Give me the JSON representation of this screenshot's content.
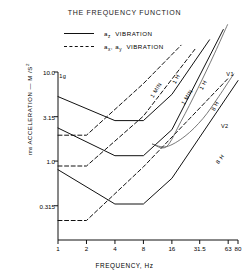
{
  "title": "THE FREQUENCY FUNCTION",
  "legend": [
    {
      "label": "a",
      "sub": "z",
      "tail": " VIBRATION",
      "style": "solid",
      "key": "legend-key-solid"
    },
    {
      "label": "a",
      "sub": "x, ay",
      "tail": " VIBRATION",
      "style": "dashed",
      "key": "legend-key-dashed"
    }
  ],
  "legend_text": {
    "solid": "az  VIBRATION",
    "dashed": "ax, ay  VIBRATION"
  },
  "axes": {
    "ylabel_main": "ACCELERATION",
    "ylabel_prefix": "rms",
    "ylabel_units": "M /S",
    "ylabel_exp": "2",
    "xlabel": "FREQUENCY, Hz",
    "unity_marker": "1g"
  },
  "chart_data": {
    "type": "line",
    "title": "THE FREQUENCY FUNCTION",
    "xlabel": "FREQUENCY, Hz",
    "ylabel": "rms ACCELERATION — M/S²",
    "xscale": "log2",
    "yscale": "log",
    "xlim": [
      1,
      80
    ],
    "ylim": [
      0.13,
      10.0
    ],
    "grid": false,
    "legend_position": "top-center",
    "xticks": [
      {
        "value": 1,
        "label": "1"
      },
      {
        "value": 2,
        "label": "2"
      },
      {
        "value": 4,
        "label": "4"
      },
      {
        "value": 8,
        "label": "8"
      },
      {
        "value": 16,
        "label": "16"
      },
      {
        "value": 31.5,
        "label": "31.5"
      },
      {
        "value": 63,
        "label": "63"
      },
      {
        "value": 80,
        "label": "80"
      }
    ],
    "yticks": [
      {
        "value": 10.0,
        "label": "10.0"
      },
      {
        "value": 3.15,
        "label": "3.15"
      },
      {
        "value": 1.0,
        "label": "1.0"
      },
      {
        "value": 0.315,
        "label": "0.315"
      }
    ],
    "annotations": [
      {
        "text": "1g",
        "x": 1.12,
        "y": 9.0,
        "rotation": 0
      },
      {
        "text": "1 MIN",
        "x": 11.0,
        "y": 6.2,
        "rotation": -58
      },
      {
        "text": "1 MIN",
        "x": 23.0,
        "y": 5.2,
        "rotation": -58
      },
      {
        "text": "1 H",
        "x": 17.5,
        "y": 8.3,
        "rotation": -62
      },
      {
        "text": "1 H",
        "x": 34.0,
        "y": 7.2,
        "rotation": -62
      },
      {
        "text": "8 H",
        "x": 46.0,
        "y": 4.1,
        "rotation": -62
      },
      {
        "text": "8 H",
        "x": 52.0,
        "y": 1.05,
        "rotation": -52
      },
      {
        "text": "V1",
        "x": 66.0,
        "y": 9.6,
        "rotation": 0
      },
      {
        "text": "V2",
        "x": 58.0,
        "y": 2.45,
        "rotation": 0
      }
    ],
    "series": [
      {
        "name": "az 1 MIN",
        "style": "solid",
        "points": [
          [
            1,
            5.3
          ],
          [
            4,
            2.85
          ],
          [
            8,
            2.85
          ],
          [
            16,
            5.6
          ],
          [
            40,
            23
          ]
        ]
      },
      {
        "name": "az 1 H",
        "style": "solid",
        "points": [
          [
            1,
            2.35
          ],
          [
            4,
            1.15
          ],
          [
            8,
            1.15
          ],
          [
            16,
            2.25
          ],
          [
            56,
            30
          ]
        ]
      },
      {
        "name": "az 8 H",
        "style": "solid",
        "points": [
          [
            1,
            0.8
          ],
          [
            4,
            0.33
          ],
          [
            8,
            0.33
          ],
          [
            16,
            0.64
          ],
          [
            80,
            8.0
          ]
        ]
      },
      {
        "name": "axy 1 MIN",
        "style": "dashed",
        "points": [
          [
            1,
            1.95
          ],
          [
            2,
            1.95
          ],
          [
            8,
            7.4
          ],
          [
            20,
            20
          ]
        ]
      },
      {
        "name": "axy 1 H",
        "style": "dashed",
        "points": [
          [
            1,
            0.88
          ],
          [
            2,
            0.88
          ],
          [
            8,
            3.2
          ],
          [
            28,
            18
          ]
        ]
      },
      {
        "name": "axy 8 H",
        "style": "dashed",
        "points": [
          [
            1,
            0.215
          ],
          [
            2,
            0.215
          ],
          [
            8,
            0.86
          ],
          [
            63,
            8.5
          ]
        ]
      },
      {
        "name": "V1",
        "style": "solid",
        "points": [
          [
            10,
            1.55
          ],
          [
            14,
            1.45
          ],
          [
            20,
            2.8
          ],
          [
            30,
            6.5
          ],
          [
            45,
            16
          ],
          [
            62,
            34
          ]
        ]
      },
      {
        "name": "V2",
        "style": "solid",
        "points": [
          [
            10,
            1.55
          ],
          [
            14,
            1.45
          ],
          [
            22,
            1.9
          ],
          [
            34,
            3.0
          ],
          [
            50,
            5.3
          ],
          [
            72,
            9.5
          ]
        ]
      }
    ]
  }
}
